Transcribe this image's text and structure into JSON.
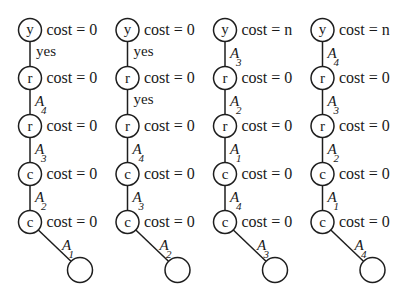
{
  "diagram": {
    "colors": {
      "ink": "#1e1e1e",
      "background": "#ffffff"
    },
    "trees": [
      {
        "nodes": [
          {
            "label": "y",
            "cost": "cost = 0"
          },
          {
            "label": "r",
            "cost": "cost = 0"
          },
          {
            "label": "r",
            "cost": "cost = 0"
          },
          {
            "label": "c",
            "cost": "cost = 0"
          },
          {
            "label": "c",
            "cost": "cost = 0"
          }
        ],
        "edges": [
          {
            "text": "yes"
          },
          {
            "letter": "A",
            "sub": "4"
          },
          {
            "letter": "A",
            "sub": "3"
          },
          {
            "letter": "A",
            "sub": "2"
          },
          {
            "letter": "A",
            "sub": "1"
          }
        ]
      },
      {
        "nodes": [
          {
            "label": "y",
            "cost": "cost = 0"
          },
          {
            "label": "r",
            "cost": "cost = 0"
          },
          {
            "label": "r",
            "cost": "cost = 0"
          },
          {
            "label": "c",
            "cost": "cost = 0"
          },
          {
            "label": "c",
            "cost": "cost = 0"
          }
        ],
        "edges": [
          {
            "text": "yes"
          },
          {
            "text": "yes"
          },
          {
            "letter": "A",
            "sub": "4"
          },
          {
            "letter": "A",
            "sub": "3"
          },
          {
            "letter": "A",
            "sub": "2"
          }
        ]
      },
      {
        "nodes": [
          {
            "label": "y",
            "cost": "cost = n"
          },
          {
            "label": "r",
            "cost": "cost = 0"
          },
          {
            "label": "r",
            "cost": "cost = 0"
          },
          {
            "label": "c",
            "cost": "cost = 0"
          },
          {
            "label": "c",
            "cost": "cost = 0"
          }
        ],
        "edges": [
          {
            "letter": "A",
            "sub": "3"
          },
          {
            "letter": "A",
            "sub": "2"
          },
          {
            "letter": "A",
            "sub": "1"
          },
          {
            "letter": "A",
            "sub": "4"
          },
          {
            "letter": "A",
            "sub": "3"
          }
        ]
      },
      {
        "nodes": [
          {
            "label": "y",
            "cost": "cost = n"
          },
          {
            "label": "r",
            "cost": "cost = 0"
          },
          {
            "label": "r",
            "cost": "cost = 0"
          },
          {
            "label": "c",
            "cost": "cost = 0"
          },
          {
            "label": "c",
            "cost": "cost = 0"
          }
        ],
        "edges": [
          {
            "letter": "A",
            "sub": "4"
          },
          {
            "letter": "A",
            "sub": "3"
          },
          {
            "letter": "A",
            "sub": "2"
          },
          {
            "letter": "A",
            "sub": "1"
          },
          {
            "letter": "A",
            "sub": "4"
          }
        ]
      }
    ]
  }
}
